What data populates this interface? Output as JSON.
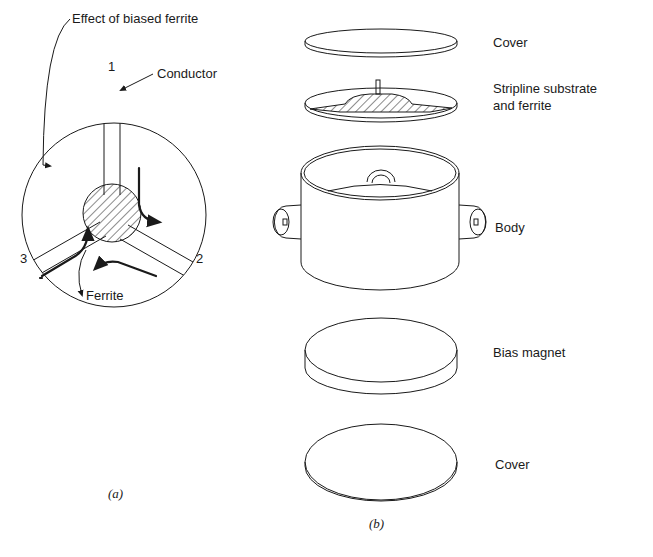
{
  "figure": {
    "panel_a": {
      "caption": "(a)",
      "labels": {
        "effect": "Effect of biased ferrite",
        "conductor": "Conductor",
        "ferrite": "Ferrite"
      },
      "ports": [
        "1",
        "2",
        "3"
      ]
    },
    "panel_b": {
      "caption": "(b)",
      "parts": [
        {
          "label": "Cover"
        },
        {
          "label_line1": "Stripline substrate",
          "label_line2": "and ferrite"
        },
        {
          "label": "Body"
        },
        {
          "label": "Bias magnet"
        },
        {
          "label": "Cover"
        }
      ]
    },
    "colors": {
      "ink": "#1a1a1a",
      "background": "#ffffff"
    }
  }
}
